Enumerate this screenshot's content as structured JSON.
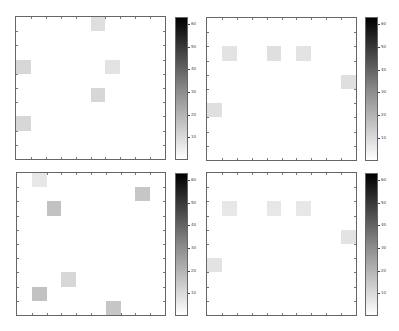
{
  "chart_data": [
    {
      "type": "heatmap",
      "title": "",
      "grid": [
        10,
        10
      ],
      "colormap": "gray_reversed",
      "clim": [
        0,
        63
      ],
      "colorbar_ticks": [
        60,
        50,
        40,
        30,
        20,
        10
      ],
      "cells": [
        {
          "col": 5,
          "row": 0,
          "value": 8
        },
        {
          "col": 0,
          "row": 3,
          "value": 10
        },
        {
          "col": 6,
          "row": 3,
          "value": 7
        },
        {
          "col": 5,
          "row": 5,
          "value": 10
        },
        {
          "col": 0,
          "row": 7,
          "value": 10
        }
      ]
    },
    {
      "type": "heatmap",
      "title": "",
      "grid": [
        10,
        10
      ],
      "colormap": "gray_reversed",
      "clim": [
        0,
        63
      ],
      "colorbar_ticks": [
        60,
        50,
        40,
        30,
        20,
        10
      ],
      "cells": [
        {
          "col": 1,
          "row": 2,
          "value": 7
        },
        {
          "col": 4,
          "row": 2,
          "value": 8
        },
        {
          "col": 6,
          "row": 2,
          "value": 7
        },
        {
          "col": 9,
          "row": 4,
          "value": 8
        },
        {
          "col": 0,
          "row": 6,
          "value": 8
        }
      ]
    },
    {
      "type": "heatmap",
      "title": "",
      "grid": [
        10,
        10
      ],
      "colormap": "gray_reversed",
      "clim": [
        0,
        63
      ],
      "colorbar_ticks": [
        60,
        50,
        40,
        30,
        20,
        10
      ],
      "cells": [
        {
          "col": 1,
          "row": 0,
          "value": 6
        },
        {
          "col": 8,
          "row": 1,
          "value": 14
        },
        {
          "col": 2,
          "row": 2,
          "value": 15
        },
        {
          "col": 3,
          "row": 7,
          "value": 10
        },
        {
          "col": 1,
          "row": 8,
          "value": 15
        },
        {
          "col": 6,
          "row": 9,
          "value": 14
        }
      ]
    },
    {
      "type": "heatmap",
      "title": "",
      "grid": [
        10,
        10
      ],
      "colormap": "gray_reversed",
      "clim": [
        0,
        63
      ],
      "colorbar_ticks": [
        60,
        50,
        40,
        30,
        20,
        10
      ],
      "cells": [
        {
          "col": 1,
          "row": 2,
          "value": 6
        },
        {
          "col": 4,
          "row": 2,
          "value": 6
        },
        {
          "col": 6,
          "row": 2,
          "value": 6
        },
        {
          "col": 9,
          "row": 4,
          "value": 7
        },
        {
          "col": 0,
          "row": 6,
          "value": 7
        }
      ]
    }
  ],
  "panels": [
    {
      "axes": {
        "x": 15,
        "y": 16,
        "w": 151,
        "h": 144
      },
      "cbar": {
        "x": 175,
        "y": 17,
        "w": 13,
        "h": 143
      }
    },
    {
      "axes": {
        "x": 206,
        "y": 17,
        "w": 151,
        "h": 144
      },
      "cbar": {
        "x": 365,
        "y": 17,
        "w": 13,
        "h": 144
      }
    },
    {
      "axes": {
        "x": 16,
        "y": 172,
        "w": 150,
        "h": 144
      },
      "cbar": {
        "x": 175,
        "y": 173,
        "w": 13,
        "h": 143
      }
    },
    {
      "axes": {
        "x": 206,
        "y": 172,
        "w": 151,
        "h": 144
      },
      "cbar": {
        "x": 365,
        "y": 173,
        "w": 13,
        "h": 143
      }
    }
  ]
}
